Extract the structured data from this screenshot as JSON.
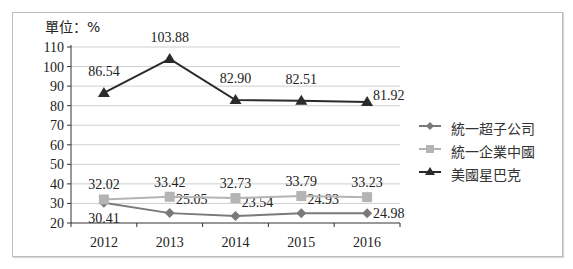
{
  "chart_data": {
    "type": "line",
    "title": "",
    "unit_label": "單位：%",
    "xlabel": "",
    "ylabel": "",
    "ylim": [
      20,
      110
    ],
    "y_ticks": [
      20,
      30,
      40,
      50,
      60,
      70,
      80,
      90,
      100,
      110
    ],
    "grid": true,
    "legend_position": "right",
    "categories": [
      "2012",
      "2013",
      "2014",
      "2015",
      "2016"
    ],
    "series": [
      {
        "name": "統一超子公司",
        "marker": "diamond",
        "color": "#7a7a7a",
        "values": [
          30.41,
          25.05,
          23.54,
          24.93,
          24.98
        ]
      },
      {
        "name": "統一企業中國",
        "marker": "square",
        "color": "#b4b4b4",
        "values": [
          32.02,
          33.42,
          32.73,
          33.79,
          33.23
        ]
      },
      {
        "name": "美國星巴克",
        "marker": "triangle",
        "color": "#2b2b2b",
        "values": [
          86.54,
          103.88,
          82.9,
          82.51,
          81.92
        ]
      }
    ]
  }
}
